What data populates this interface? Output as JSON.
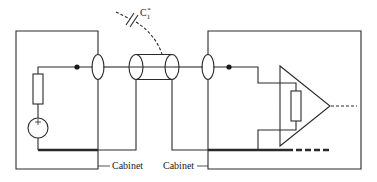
{
  "diagram": {
    "type": "circuit-schematic",
    "colors": {
      "line": "#2a2a2a",
      "background": "#ffffff"
    },
    "labels": {
      "capacitance": "C",
      "capacitance_sub": "1",
      "capacitance_sup": "*",
      "cabinet_left": "Cabinet",
      "cabinet_right": "Cabinet"
    },
    "components": [
      {
        "id": "left-cabinet",
        "kind": "enclosure"
      },
      {
        "id": "voltage-source",
        "kind": "source",
        "polarity": "+"
      },
      {
        "id": "source-resistor",
        "kind": "resistor"
      },
      {
        "id": "left-junction",
        "kind": "node"
      },
      {
        "id": "left-ferrite",
        "kind": "ferrite-bead"
      },
      {
        "id": "coax-cable",
        "kind": "shielded-cable"
      },
      {
        "id": "stray-capacitor",
        "kind": "capacitor",
        "label": "C1*"
      },
      {
        "id": "right-ferrite",
        "kind": "ferrite-bead"
      },
      {
        "id": "right-junction",
        "kind": "node"
      },
      {
        "id": "right-cabinet",
        "kind": "enclosure"
      },
      {
        "id": "amplifier",
        "kind": "differential-amplifier"
      },
      {
        "id": "input-resistor",
        "kind": "resistor"
      },
      {
        "id": "ground-bus",
        "kind": "ground-conductor"
      }
    ]
  }
}
